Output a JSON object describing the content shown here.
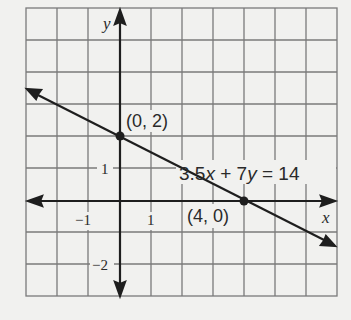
{
  "graph": {
    "equation": "3.5x + 7y = 14",
    "equation_parts": {
      "a": "3.5",
      "x": "x",
      "plus": " + 7",
      "y": "y",
      "rhs": " = 14"
    },
    "axis_x_label": "x",
    "axis_y_label": "y",
    "ticks": {
      "x_neg1": "−1",
      "x_1": "1",
      "y_1": "1",
      "y_neg2": "−2"
    },
    "points": [
      {
        "label": "(0, 2)",
        "x": 0,
        "y": 2
      },
      {
        "label": "(4, 0)",
        "x": 4,
        "y": 0
      }
    ],
    "grid": {
      "x_min": -3,
      "x_max": 7,
      "y_min": -3,
      "y_max": 6
    },
    "colors": {
      "grid": "#7a7a7a",
      "ink": "#1e1e1e",
      "background": "#f1f1ef"
    }
  }
}
